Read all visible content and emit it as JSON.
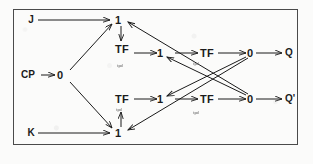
{
  "figure": {
    "type": "diagram",
    "frame": {
      "stroke": "#4a4a4a",
      "background": "#fbfbfa"
    },
    "ink_color": "#1b1b1b"
  },
  "inputs": [
    {
      "id": "j",
      "label": "J"
    },
    {
      "id": "cp",
      "label": "CP"
    },
    {
      "id": "k",
      "label": "K"
    }
  ],
  "outputs": [
    {
      "id": "q",
      "label": "Q"
    },
    {
      "id": "qbar",
      "label": "Q'"
    }
  ],
  "nodes": [
    {
      "id": "cp-0",
      "label": "0",
      "kind": "gain"
    },
    {
      "id": "top-1",
      "label": "1",
      "kind": "gain"
    },
    {
      "id": "top-tf",
      "label": "TF",
      "kind": "transfer"
    },
    {
      "id": "top-1b",
      "label": "1",
      "kind": "gain"
    },
    {
      "id": "top-tf2",
      "label": "TF",
      "kind": "transfer"
    },
    {
      "id": "top-0",
      "label": "0",
      "kind": "gain"
    },
    {
      "id": "bot-tf",
      "label": "TF",
      "kind": "transfer"
    },
    {
      "id": "bot-1b",
      "label": "1",
      "kind": "gain"
    },
    {
      "id": "bot-tf2",
      "label": "TF",
      "kind": "transfer"
    },
    {
      "id": "bot-0",
      "label": "0",
      "kind": "gain"
    },
    {
      "id": "bot-1",
      "label": "1",
      "kind": "gain"
    }
  ],
  "annotations": [
    {
      "id": "ann-1",
      "label": "tpd"
    },
    {
      "id": "ann-2",
      "label": "tpd"
    },
    {
      "id": "ann-3",
      "label": "tpd"
    },
    {
      "id": "ann-4",
      "label": "tpd"
    }
  ]
}
